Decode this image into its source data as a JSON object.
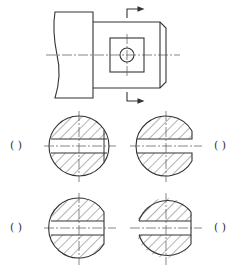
{
  "question": {
    "text_cropped": ""
  },
  "main_view": {
    "description": "shaft front view with square flat and through-hole, section cut arrows",
    "section_arrow_top": "right-pointing",
    "section_arrow_bottom": "right-pointing"
  },
  "options": [
    {
      "id": "A",
      "position": "top-left",
      "label": "(    )",
      "shape": "full circle, through slot"
    },
    {
      "id": "B",
      "position": "top-right",
      "label": "(    )",
      "shape": "circle with open slot on right"
    },
    {
      "id": "C",
      "position": "bottom-left",
      "label": "(    )",
      "shape": "circle flattened on right, through slot"
    },
    {
      "id": "D",
      "position": "bottom-right",
      "label": "(    )",
      "shape": "circle flattened on right, slot open on left"
    }
  ],
  "colors": {
    "line": "#333333",
    "centerline": "#555555",
    "hatch": "#555555"
  }
}
